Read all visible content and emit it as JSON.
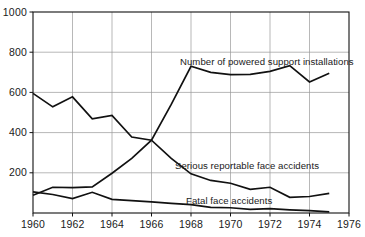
{
  "chart_data": {
    "type": "line",
    "title": "",
    "subtitle": "",
    "xlabel": "",
    "ylabel": "",
    "xlim": [
      1960,
      1976
    ],
    "ylim": [
      0,
      1000
    ],
    "grid": true,
    "legend_position": "inline-annotations",
    "x_ticks": [
      "1960",
      "1962",
      "1964",
      "1966",
      "1968",
      "1970",
      "1972",
      "1974",
      "1976"
    ],
    "x_tick_values": [
      1960,
      1962,
      1964,
      1966,
      1968,
      1970,
      1972,
      1974,
      1976
    ],
    "y_ticks": [
      "200",
      "400",
      "600",
      "800",
      "1000"
    ],
    "y_tick_values": [
      200,
      400,
      600,
      800,
      1000
    ],
    "x": [
      1960,
      1961,
      1962,
      1963,
      1964,
      1965,
      1966,
      1967,
      1968,
      1969,
      1970,
      1971,
      1972,
      1973,
      1974,
      1975
    ],
    "series": [
      {
        "name": "Number of powered support installations",
        "color": "#111111",
        "values": [
          88,
          128,
          126,
          130,
          198,
          272,
          362,
          540,
          730,
          700,
          688,
          690,
          705,
          733,
          652,
          695
        ]
      },
      {
        "name": "Serious reportable face accidents",
        "color": "#111111",
        "values": [
          595,
          528,
          578,
          468,
          486,
          378,
          362,
          272,
          195,
          162,
          148,
          118,
          128,
          78,
          82,
          98
        ]
      },
      {
        "name": "Fatal face accidents",
        "color": "#111111",
        "values": [
          105,
          92,
          72,
          103,
          68,
          62,
          55,
          48,
          42,
          28,
          26,
          18,
          22,
          16,
          12,
          6
        ]
      }
    ],
    "annotations": [
      {
        "id": "installations-label",
        "text": "Number of powered support installations",
        "x_px": 180,
        "y_px": 57
      },
      {
        "id": "serious-label",
        "text": "Serious reportable face accidents",
        "x_px": 175,
        "y_px": 161
      },
      {
        "id": "fatal-label",
        "text": "Fatal face accidents",
        "x_px": 186,
        "y_px": 196
      }
    ],
    "axis_color": "#111111",
    "grid_color": "#9a9a9a",
    "background_color": "#ffffff"
  },
  "plot_geometry": {
    "left": 33,
    "right": 349,
    "top": 12,
    "bottom": 213
  }
}
